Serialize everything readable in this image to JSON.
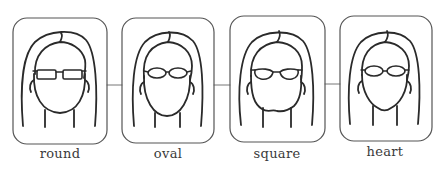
{
  "diagram": {
    "panels": [
      {
        "id": "round",
        "label": "round",
        "glasses": "rectangular"
      },
      {
        "id": "oval",
        "label": "oval",
        "glasses": "oval"
      },
      {
        "id": "square",
        "label": "square",
        "glasses": "oval-rounded"
      },
      {
        "id": "heart",
        "label": "heart",
        "glasses": "oval"
      }
    ],
    "colors": {
      "stroke": "#2a2a2a",
      "frame": "#555555",
      "background": "#ffffff",
      "label": "#3a3a3a"
    }
  }
}
